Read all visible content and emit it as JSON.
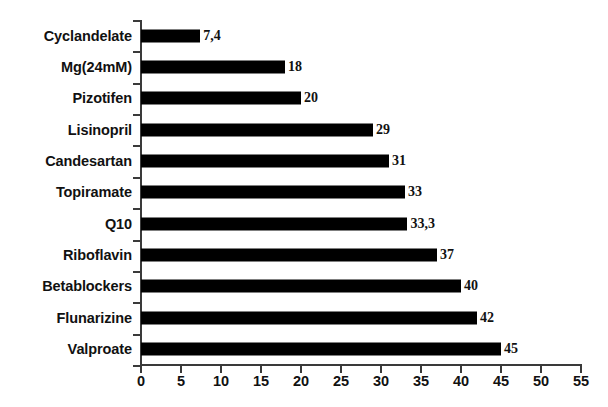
{
  "chart_data": {
    "type": "bar",
    "orientation": "horizontal",
    "title": "",
    "xlabel": "",
    "ylabel": "",
    "xlim": [
      0,
      55
    ],
    "xticks": [
      0,
      5,
      10,
      15,
      20,
      25,
      30,
      35,
      40,
      45,
      50,
      55
    ],
    "grid": false,
    "legend": false,
    "bar_color": "#000000",
    "categories": [
      "Cyclandelate",
      "Mg(24mM)",
      "Pizotifen",
      "Lisinopril",
      "Candesartan",
      "Topiramate",
      "Q10",
      "Riboflavin",
      "Betablockers",
      "Flunarizine",
      "Valproate"
    ],
    "values": [
      7.4,
      18,
      20,
      29,
      31,
      33,
      33.3,
      37,
      40,
      42,
      45
    ],
    "value_labels": [
      "7,4",
      "18",
      "20",
      "29",
      "31",
      "33",
      "33,3",
      "37",
      "40",
      "42",
      "45"
    ]
  },
  "caption": ""
}
